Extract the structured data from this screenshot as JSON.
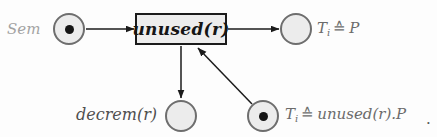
{
  "diagram": {
    "type": "petri-net",
    "sem_label": "Sem",
    "transition_label": "unused(r)",
    "decrem_label": "decrem(r)",
    "ti_p": {
      "base": "T",
      "sub": "i",
      "rel": "≙",
      "rhs": "P"
    },
    "ti_unused": {
      "base": "T",
      "sub": "i",
      "rel": "≙",
      "rhs": "unused(r).P"
    },
    "period": ".",
    "places": [
      {
        "name": "Sem",
        "token": true
      },
      {
        "name": "Ti ≙ P",
        "token": false
      },
      {
        "name": "decrem(r)",
        "token": false
      },
      {
        "name": "Ti ≙ unused(r).P",
        "token": true
      }
    ],
    "arrows": [
      {
        "from": "Sem",
        "to": "unused(r)"
      },
      {
        "from": "unused(r)",
        "to": "Ti ≙ P"
      },
      {
        "from": "unused(r)",
        "to": "decrem(r)"
      },
      {
        "from": "Ti ≙ unused(r).P",
        "to": "unused(r)"
      }
    ]
  },
  "colors": {
    "background": "#fdfdfd",
    "place_fill": "#ececec",
    "place_border": "#6e6e6e",
    "transition_fill": "#ededed",
    "transition_border": "#1b1b1b",
    "arrow": "#1b1b1b",
    "token": "#151515",
    "label_light_gray": "#a3a3a3",
    "label_mid_gray": "#6b6b6b",
    "label_dark_gray": "#4f4f4f"
  }
}
